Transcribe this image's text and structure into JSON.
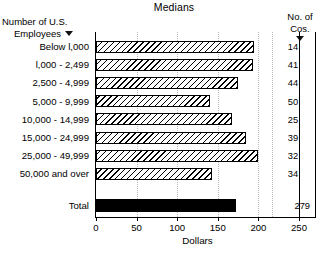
{
  "chart_data": {
    "type": "bar",
    "orientation": "horizontal",
    "title": "Medians",
    "xlabel": "Dollars",
    "ylabel": "Number of U.S. Employees",
    "xlim": [
      0,
      250
    ],
    "xticks": [
      0,
      50,
      100,
      150,
      200,
      250
    ],
    "xtick_labels": [
      "0",
      "50",
      "100",
      "150",
      "200",
      "250"
    ],
    "grid": true,
    "legend": "none",
    "categories": [
      "Below l,000",
      "l,000 - 2,499",
      "2,500 - 4,999",
      "5,000 - 9,999",
      "10,000 - 14,999",
      "15,000 - 24,999",
      "25,000 - 49,999",
      "50,000 and over"
    ],
    "values": [
      195,
      193,
      175,
      140,
      168,
      185,
      200,
      143
    ],
    "total_category": "Total",
    "total_value": 172,
    "companies_column_header": [
      "No. of",
      "Cos."
    ],
    "companies": [
      14,
      41,
      44,
      50,
      25,
      39,
      32,
      34
    ],
    "companies_total": 279
  },
  "header": {
    "left_line1": "Number of U.S.",
    "left_line2": "Employees",
    "right_line1": "No. of",
    "right_line2": "Cos.",
    "marker_icon": "down-triangle-marker"
  },
  "axis": {
    "x_title": "Dollars",
    "ticks": [
      "0",
      "50",
      "100",
      "150",
      "200",
      "250"
    ]
  },
  "rows": [
    {
      "label": "Below l,000",
      "value": 195,
      "companies": "14"
    },
    {
      "label": "l,000 - 2,499",
      "value": 193,
      "companies": "41"
    },
    {
      "label": "2,500 - 4,999",
      "value": 175,
      "companies": "44"
    },
    {
      "label": "5,000 - 9,999",
      "value": 140,
      "companies": "50"
    },
    {
      "label": "10,000 - 14,999",
      "value": 168,
      "companies": "25"
    },
    {
      "label": "15,000 - 24,999",
      "value": 185,
      "companies": "39"
    },
    {
      "label": "25,000 - 49,999",
      "value": 200,
      "companies": "32"
    },
    {
      "label": "50,000 and over",
      "value": 143,
      "companies": "34"
    }
  ],
  "total_row": {
    "label": "Total",
    "value": 172,
    "companies": "279"
  },
  "title": "Medians",
  "colors": {
    "bar_outline": "#000000",
    "bar_fill": "#ffffff",
    "hatch": "#000000",
    "total_bar": "#000000",
    "gridline": "#b9b9b9",
    "text": "#000000"
  }
}
